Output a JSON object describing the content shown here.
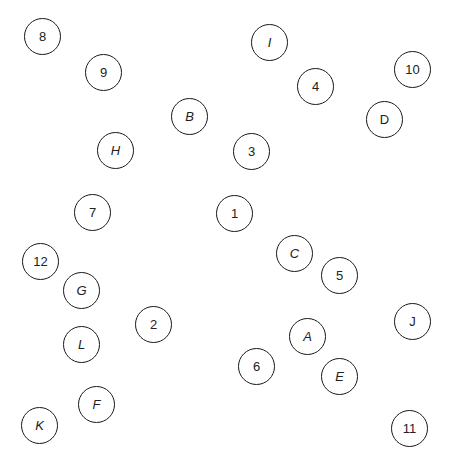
{
  "circle_color": "#1a1a1a",
  "nodes": [
    {
      "label": "8",
      "x": 43,
      "y": 37,
      "italic": false
    },
    {
      "label": "I",
      "x": 270,
      "y": 43,
      "italic": true
    },
    {
      "label": "9",
      "x": 104,
      "y": 73,
      "italic": false
    },
    {
      "label": "10",
      "x": 413,
      "y": 70,
      "italic": false
    },
    {
      "label": "4",
      "x": 316,
      "y": 87,
      "italic": false
    },
    {
      "label": "B",
      "x": 190,
      "y": 117,
      "italic": true
    },
    {
      "label": "D",
      "x": 385,
      "y": 120,
      "italic": false
    },
    {
      "label": "H",
      "x": 116,
      "y": 151,
      "italic": true
    },
    {
      "label": "3",
      "x": 252,
      "y": 152,
      "italic": false
    },
    {
      "label": "7",
      "x": 93,
      "y": 213,
      "italic": false
    },
    {
      "label": "1",
      "x": 235,
      "y": 214,
      "italic": false
    },
    {
      "label": "C",
      "x": 295,
      "y": 254,
      "italic": true
    },
    {
      "label": "12",
      "x": 41,
      "y": 262,
      "italic": false
    },
    {
      "label": "5",
      "x": 340,
      "y": 276,
      "italic": false
    },
    {
      "label": "G",
      "x": 82,
      "y": 291,
      "italic": true
    },
    {
      "label": "2",
      "x": 154,
      "y": 325,
      "italic": false
    },
    {
      "label": "J",
      "x": 413,
      "y": 322,
      "italic": false
    },
    {
      "label": "A",
      "x": 308,
      "y": 337,
      "italic": true
    },
    {
      "label": "L",
      "x": 82,
      "y": 345,
      "italic": true
    },
    {
      "label": "6",
      "x": 257,
      "y": 367,
      "italic": false
    },
    {
      "label": "E",
      "x": 340,
      "y": 377,
      "italic": true
    },
    {
      "label": "F",
      "x": 97,
      "y": 405,
      "italic": true
    },
    {
      "label": "K",
      "x": 40,
      "y": 426,
      "italic": true
    },
    {
      "label": "11",
      "x": 410,
      "y": 429,
      "italic": false
    }
  ]
}
